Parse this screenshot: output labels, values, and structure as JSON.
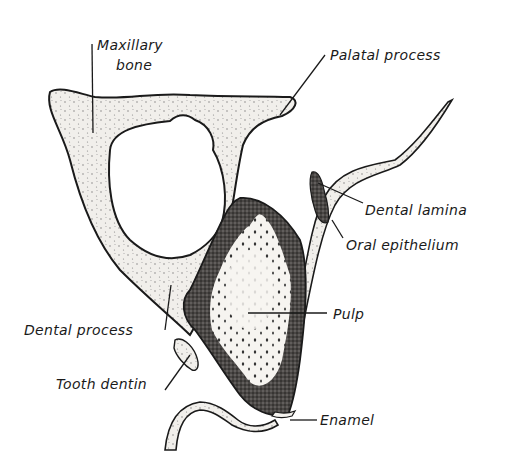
{
  "figure": {
    "type": "anatomical line drawing",
    "labels": {
      "maxillary_bone_line1": "Maxillary",
      "maxillary_bone_line2": "bone",
      "palatal_process": "Palatal process",
      "dental_lamina": "Dental lamina",
      "oral_epithelium": "Oral epithelium",
      "pulp": "Pulp",
      "dental_process": "Dental process",
      "tooth_dentin": "Tooth dentin",
      "enamel": "Enamel"
    },
    "colors": {
      "ink": "#1a1a1a",
      "bone_fill": "#ece9e4",
      "dentin_fill": "#3c3a38",
      "pulp_fill": "#f4f2ee",
      "background": "#ffffff"
    }
  }
}
